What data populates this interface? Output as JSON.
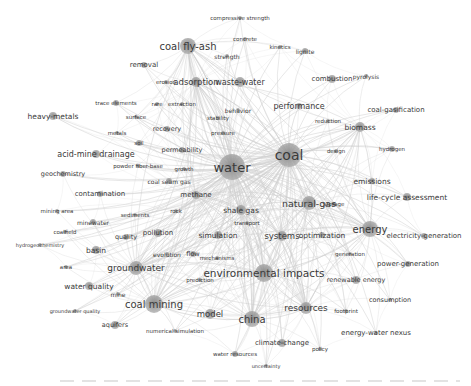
{
  "diagram": {
    "type": "keyword co-occurrence network",
    "colors": {
      "background": "#ffffff",
      "node": "#9a9a9a",
      "edge": "#cfcfcf",
      "label": "#3a3a3a"
    },
    "nodes": [
      {
        "id": "water",
        "label": "water",
        "x": 232,
        "y": 167,
        "r": 13,
        "fs": 13
      },
      {
        "id": "coal",
        "label": "coal",
        "x": 289,
        "y": 155,
        "r": 12,
        "fs": 14
      },
      {
        "id": "environmental-impacts",
        "label": "environmental impacts",
        "x": 264,
        "y": 273,
        "r": 9,
        "fs": 10.5
      },
      {
        "id": "coal-mining",
        "label": "coal mining",
        "x": 154,
        "y": 304,
        "r": 9,
        "fs": 10
      },
      {
        "id": "china",
        "label": "china",
        "x": 252,
        "y": 319,
        "r": 8,
        "fs": 10
      },
      {
        "id": "natural-gas",
        "label": "natural-gas",
        "x": 309,
        "y": 203,
        "r": 7,
        "fs": 9.5
      },
      {
        "id": "energy",
        "label": "energy",
        "x": 370,
        "y": 229,
        "r": 8,
        "fs": 10
      },
      {
        "id": "coal-fly-ash",
        "label": "coal fly-ash",
        "x": 188,
        "y": 46,
        "r": 8,
        "fs": 10
      },
      {
        "id": "groundwater",
        "label": "groundwater",
        "x": 136,
        "y": 268,
        "r": 7,
        "fs": 9
      },
      {
        "id": "resources",
        "label": "resources",
        "x": 306,
        "y": 308,
        "r": 6,
        "fs": 9
      },
      {
        "id": "model",
        "label": "model",
        "x": 210,
        "y": 314,
        "r": 5,
        "fs": 8.5
      },
      {
        "id": "systems",
        "label": "systems",
        "x": 282,
        "y": 236,
        "r": 5,
        "fs": 8.5
      },
      {
        "id": "optimization",
        "label": "optimization",
        "x": 322,
        "y": 235,
        "r": 3,
        "fs": 7.5
      },
      {
        "id": "simulation",
        "label": "simulation",
        "x": 218,
        "y": 235,
        "r": 4,
        "fs": 7.5
      },
      {
        "id": "adsorption",
        "label": "adsorption",
        "x": 196,
        "y": 82,
        "r": 5,
        "fs": 8.5
      },
      {
        "id": "waste-water",
        "label": "waste-water",
        "x": 240,
        "y": 82,
        "r": 5,
        "fs": 8
      },
      {
        "id": "removal",
        "label": "removal",
        "x": 144,
        "y": 65,
        "r": 3,
        "fs": 7
      },
      {
        "id": "erosion",
        "label": "erosion",
        "x": 166,
        "y": 82,
        "r": 2,
        "fs": 5.5
      },
      {
        "id": "compressive-strength",
        "label": "compressive strength",
        "x": 240,
        "y": 18,
        "r": 2,
        "fs": 5.5
      },
      {
        "id": "concrete",
        "label": "concrete",
        "x": 245,
        "y": 39,
        "r": 2,
        "fs": 5.5
      },
      {
        "id": "strength",
        "label": "strength",
        "x": 227,
        "y": 56,
        "r": 2,
        "fs": 6
      },
      {
        "id": "lignite",
        "label": "lignite",
        "x": 305,
        "y": 51,
        "r": 3,
        "fs": 6
      },
      {
        "id": "kinetics",
        "label": "kinetics",
        "x": 280,
        "y": 47,
        "r": 2,
        "fs": 5.5
      },
      {
        "id": "combustion",
        "label": "combustion",
        "x": 332,
        "y": 79,
        "r": 4,
        "fs": 7
      },
      {
        "id": "pyrolysis",
        "label": "pyrolysis",
        "x": 366,
        "y": 76,
        "r": 2,
        "fs": 6
      },
      {
        "id": "performance",
        "label": "performance",
        "x": 299,
        "y": 106,
        "r": 3,
        "fs": 8
      },
      {
        "id": "coal-gasification",
        "label": "coal-gasification",
        "x": 396,
        "y": 110,
        "r": 3,
        "fs": 7
      },
      {
        "id": "reduction",
        "label": "reduction",
        "x": 328,
        "y": 121,
        "r": 2,
        "fs": 5.5
      },
      {
        "id": "biomass",
        "label": "biomass",
        "x": 360,
        "y": 127,
        "r": 5,
        "fs": 7.5
      },
      {
        "id": "hydrogen",
        "label": "hydrogen",
        "x": 392,
        "y": 149,
        "r": 3,
        "fs": 5.5
      },
      {
        "id": "design",
        "label": "design",
        "x": 336,
        "y": 151,
        "r": 2,
        "fs": 5.5
      },
      {
        "id": "emissions",
        "label": "emissions",
        "x": 372,
        "y": 181,
        "r": 3,
        "fs": 7.5
      },
      {
        "id": "life-cycle-assessment",
        "label": "life-cycle assessment",
        "x": 407,
        "y": 197,
        "r": 4,
        "fs": 7.5
      },
      {
        "id": "storage",
        "label": "storage",
        "x": 334,
        "y": 204,
        "r": 2,
        "fs": 5.5
      },
      {
        "id": "electricity-generation",
        "label": "electricity-generation",
        "x": 424,
        "y": 236,
        "r": 3,
        "fs": 7
      },
      {
        "id": "generation",
        "label": "generation",
        "x": 350,
        "y": 254,
        "r": 2,
        "fs": 5.5
      },
      {
        "id": "power-generation",
        "label": "power-generation",
        "x": 408,
        "y": 264,
        "r": 3,
        "fs": 7
      },
      {
        "id": "renewable-energy",
        "label": "renewable energy",
        "x": 356,
        "y": 280,
        "r": 4,
        "fs": 6.5
      },
      {
        "id": "consumption",
        "label": "consumption",
        "x": 390,
        "y": 300,
        "r": 2,
        "fs": 6.5
      },
      {
        "id": "footprint",
        "label": "footprint",
        "x": 346,
        "y": 311,
        "r": 2,
        "fs": 5.5
      },
      {
        "id": "energy-water-nexus",
        "label": "energy-water nexus",
        "x": 376,
        "y": 333,
        "r": 2,
        "fs": 7
      },
      {
        "id": "climate-change",
        "label": "climate-change",
        "x": 282,
        "y": 343,
        "r": 4,
        "fs": 7
      },
      {
        "id": "policy",
        "label": "policy",
        "x": 320,
        "y": 349,
        "r": 2,
        "fs": 5.5
      },
      {
        "id": "water-resources",
        "label": "water resources",
        "x": 235,
        "y": 354,
        "r": 3,
        "fs": 5.5
      },
      {
        "id": "uncertainty",
        "label": "uncertainty",
        "x": 266,
        "y": 366,
        "r": 2,
        "fs": 5
      },
      {
        "id": "heavy-metals",
        "label": "heavy-metals",
        "x": 53,
        "y": 116,
        "r": 4,
        "fs": 7.5
      },
      {
        "id": "trace-elements",
        "label": "trace elements",
        "x": 116,
        "y": 103,
        "r": 3,
        "fs": 5.5
      },
      {
        "id": "surface",
        "label": "surface",
        "x": 136,
        "y": 117,
        "r": 2,
        "fs": 5.5
      },
      {
        "id": "rare-earth",
        "label": "rare",
        "x": 157,
        "y": 104,
        "r": 2,
        "fs": 5.5
      },
      {
        "id": "extraction",
        "label": "extraction",
        "x": 182,
        "y": 104,
        "r": 2,
        "fs": 5.5
      },
      {
        "id": "behavior",
        "label": "behavior",
        "x": 238,
        "y": 110,
        "r": 2,
        "fs": 6
      },
      {
        "id": "stability",
        "label": "stability",
        "x": 218,
        "y": 118,
        "r": 2,
        "fs": 5.5
      },
      {
        "id": "recovery",
        "label": "recovery",
        "x": 167,
        "y": 129,
        "r": 3,
        "fs": 6.5
      },
      {
        "id": "mobility",
        "label": "metals",
        "x": 117,
        "y": 133,
        "r": 2,
        "fs": 5.5
      },
      {
        "id": "pressure",
        "label": "pressure",
        "x": 223,
        "y": 133,
        "r": 2,
        "fs": 5.5
      },
      {
        "id": "soil",
        "label": "soil",
        "x": 139,
        "y": 143,
        "r": 3,
        "fs": 5.5
      },
      {
        "id": "acid-mine-drainage",
        "label": "acid-mine drainage",
        "x": 96,
        "y": 154,
        "r": 4,
        "fs": 8
      },
      {
        "id": "permeability",
        "label": "permeability",
        "x": 182,
        "y": 150,
        "r": 3,
        "fs": 6.5
      },
      {
        "id": "powder-fiber-base",
        "label": "powder fiber-base",
        "x": 138,
        "y": 166,
        "r": 2,
        "fs": 5.5
      },
      {
        "id": "growth",
        "label": "growth",
        "x": 184,
        "y": 169,
        "r": 2,
        "fs": 5.5
      },
      {
        "id": "geochemistry",
        "label": "geochemistry",
        "x": 63,
        "y": 174,
        "r": 3,
        "fs": 6.5
      },
      {
        "id": "coal-seam-gas",
        "label": "coal seam gas",
        "x": 169,
        "y": 181,
        "r": 3,
        "fs": 6
      },
      {
        "id": "methane",
        "label": "methane",
        "x": 196,
        "y": 195,
        "r": 4,
        "fs": 7
      },
      {
        "id": "contamination",
        "label": "contamination",
        "x": 100,
        "y": 194,
        "r": 3,
        "fs": 7
      },
      {
        "id": "shale-gas",
        "label": "shale gas",
        "x": 241,
        "y": 210,
        "r": 5,
        "fs": 7.5
      },
      {
        "id": "transport",
        "label": "transport",
        "x": 247,
        "y": 223,
        "r": 2,
        "fs": 5.5
      },
      {
        "id": "mining-area",
        "label": "mining area",
        "x": 57,
        "y": 211,
        "r": 2,
        "fs": 5.5
      },
      {
        "id": "rock",
        "label": "rock",
        "x": 176,
        "y": 211,
        "r": 2,
        "fs": 5.5
      },
      {
        "id": "sediments",
        "label": "sediments",
        "x": 135,
        "y": 215,
        "r": 2,
        "fs": 5.5
      },
      {
        "id": "mine-water",
        "label": "minewater",
        "x": 93,
        "y": 222,
        "r": 3,
        "fs": 6
      },
      {
        "id": "coalfield",
        "label": "coalfield",
        "x": 65,
        "y": 232,
        "r": 2,
        "fs": 5.5
      },
      {
        "id": "quality",
        "label": "quality",
        "x": 126,
        "y": 237,
        "r": 3,
        "fs": 6.5
      },
      {
        "id": "pollution",
        "label": "pollution",
        "x": 158,
        "y": 233,
        "r": 4,
        "fs": 7
      },
      {
        "id": "hydrogeochemistry",
        "label": "hydrogeochemistry",
        "x": 40,
        "y": 245,
        "r": 2,
        "fs": 5
      },
      {
        "id": "basin",
        "label": "basin",
        "x": 96,
        "y": 250,
        "r": 4,
        "fs": 7.5
      },
      {
        "id": "evolution",
        "label": "evolution",
        "x": 167,
        "y": 254,
        "r": 2,
        "fs": 6
      },
      {
        "id": "flow",
        "label": "flow",
        "x": 193,
        "y": 254,
        "r": 3,
        "fs": 6.5
      },
      {
        "id": "mechanisms",
        "label": "mechanisms",
        "x": 217,
        "y": 258,
        "r": 2,
        "fs": 5.5
      },
      {
        "id": "area",
        "label": "area",
        "x": 66,
        "y": 267,
        "r": 2,
        "fs": 5.5
      },
      {
        "id": "prediction",
        "label": "prediction",
        "x": 200,
        "y": 280,
        "r": 2,
        "fs": 5.5
      },
      {
        "id": "water-quality",
        "label": "water quality",
        "x": 89,
        "y": 286,
        "r": 4,
        "fs": 7.5
      },
      {
        "id": "mine",
        "label": "mine",
        "x": 118,
        "y": 294,
        "r": 2,
        "fs": 6
      },
      {
        "id": "groundwater-quality",
        "label": "groundwater quality",
        "x": 75,
        "y": 311,
        "r": 2,
        "fs": 5
      },
      {
        "id": "aquifers",
        "label": "aquifers",
        "x": 115,
        "y": 325,
        "r": 4,
        "fs": 6.5
      },
      {
        "id": "numerical-simulation",
        "label": "numerical simulation",
        "x": 175,
        "y": 331,
        "r": 2,
        "fs": 5.5
      }
    ],
    "hubs": [
      "water",
      "coal",
      "environmental-impacts",
      "coal-mining",
      "china",
      "energy",
      "natural-gas",
      "coal-fly-ash",
      "groundwater",
      "resources",
      "biomass",
      "systems",
      "adsorption",
      "shale-gas",
      "methane"
    ]
  }
}
